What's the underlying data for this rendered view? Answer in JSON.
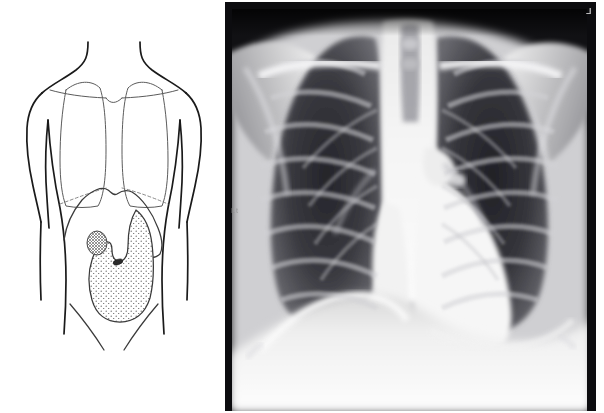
{
  "figure": {
    "panel_count": 2,
    "background_color": "#ffffff"
  },
  "diagram": {
    "label": "anatomical-line-drawing",
    "view": "anterior",
    "line_color": "#1a1a1a",
    "organ_line_color": "#5b5b5b",
    "structures": [
      {
        "name": "torso-outline",
        "style": "solid-dark-contour"
      },
      {
        "name": "neck",
        "style": "solid-dark-contour"
      },
      {
        "name": "left-shoulder",
        "style": "solid-dark-contour"
      },
      {
        "name": "right-shoulder",
        "style": "solid-dark-contour"
      },
      {
        "name": "left-arm",
        "style": "solid-dark-contour"
      },
      {
        "name": "right-arm",
        "style": "solid-dark-contour"
      },
      {
        "name": "left-lung-field",
        "style": "thin-grey-outline"
      },
      {
        "name": "right-lung-field",
        "style": "thin-grey-outline"
      },
      {
        "name": "left-clavicle",
        "style": "thin-grey-line"
      },
      {
        "name": "right-clavicle",
        "style": "thin-grey-line"
      },
      {
        "name": "diaphragm-dome",
        "style": "thin-grey-dashed"
      },
      {
        "name": "liver-border",
        "style": "solid-grey-contour"
      },
      {
        "name": "stomach",
        "style": "stippled-fill",
        "fill": "stipple-dots"
      },
      {
        "name": "gallbladder",
        "style": "cross-hatched-oval",
        "fill": "hatch"
      },
      {
        "name": "lesion-marker",
        "style": "small-dark-ellipse"
      },
      {
        "name": "left-inguinal-ligament",
        "style": "thin-grey-line"
      },
      {
        "name": "right-inguinal-ligament",
        "style": "thin-grey-line"
      }
    ]
  },
  "xray": {
    "label": "pa-chest-radiograph",
    "projection": "PA",
    "side_marker": "L",
    "edge_marker": "Lt",
    "border_color": "#0a0a0a",
    "features": [
      {
        "name": "right-lung-field",
        "description": "radiolucent dark lung field, left of image"
      },
      {
        "name": "left-lung-field",
        "description": "radiolucent dark lung field, right of image"
      },
      {
        "name": "rib-cage",
        "description": "overlapping posterior and anterior rib shadows"
      },
      {
        "name": "clavicles",
        "description": "bright horizontal bony shadows across the apices"
      },
      {
        "name": "trachea",
        "description": "vertical midline lucency above carina"
      },
      {
        "name": "mediastinum",
        "description": "bright central soft-tissue column"
      },
      {
        "name": "cardiac-silhouette",
        "description": "opaque heart shadow projecting left of midline"
      },
      {
        "name": "right-hemidiaphragm",
        "description": "dome-shaped bright curve at lung base"
      },
      {
        "name": "left-hemidiaphragm",
        "description": "dome-shaped bright curve at lung base"
      },
      {
        "name": "costophrenic-angles",
        "description": "sharp lateral recesses at both bases"
      },
      {
        "name": "scapulae",
        "description": "bright oblique shadows over upper lateral chest"
      },
      {
        "name": "soft-tissue-shoulders",
        "description": "bright opaque shoulder regions"
      },
      {
        "name": "spine",
        "description": "vertebral bodies visible behind mediastinum"
      }
    ]
  }
}
